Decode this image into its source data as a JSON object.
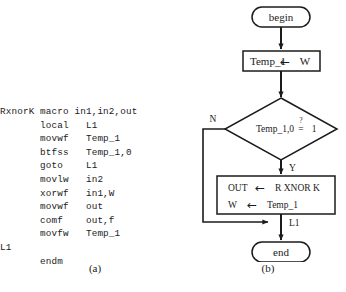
{
  "figure": {
    "caption_a": "(a)",
    "caption_b": "(b)"
  },
  "code": {
    "language": "pic-assembly",
    "listing": "RxnorK macro in1,in2,out\n       local   L1\n       movwf   Temp_1\n       btfss   Temp_1,0\n       goto    L1\n       movlw   in2\n       xorwf   in1,W\n       movwf   out\n       comf    out,f\n       movfw   Temp_1\nL1\n       endm",
    "lines": [
      {
        "label": "RxnorK",
        "mnemonic": "macro",
        "operands": "in1,in2,out"
      },
      {
        "label": "",
        "mnemonic": "local",
        "operands": "L1"
      },
      {
        "label": "",
        "mnemonic": "movwf",
        "operands": "Temp_1"
      },
      {
        "label": "",
        "mnemonic": "btfss",
        "operands": "Temp_1,0"
      },
      {
        "label": "",
        "mnemonic": "goto",
        "operands": "L1"
      },
      {
        "label": "",
        "mnemonic": "movlw",
        "operands": "in2"
      },
      {
        "label": "",
        "mnemonic": "xorwf",
        "operands": "in1,W"
      },
      {
        "label": "",
        "mnemonic": "movwf",
        "operands": "out"
      },
      {
        "label": "",
        "mnemonic": "comf",
        "operands": "out,f"
      },
      {
        "label": "",
        "mnemonic": "movfw",
        "operands": "Temp_1"
      },
      {
        "label": "L1",
        "mnemonic": "",
        "operands": ""
      },
      {
        "label": "",
        "mnemonic": "endm",
        "operands": ""
      }
    ]
  },
  "flowchart": {
    "begin_label": "begin",
    "end_label": "end",
    "assign_temp": "Temp_1",
    "assign_temp_arrow": "←",
    "assign_temp_source": "W",
    "decision_expr": "Temp_1,0",
    "decision_question": "?",
    "decision_eq": "=",
    "decision_value": "1",
    "branch_no": "N",
    "branch_yes": "Y",
    "process_out": "OUT",
    "process_out_arrow": "←",
    "process_out_expr": "R XNOR K",
    "process_w": "W",
    "process_w_arrow": "←",
    "process_w_expr": "Temp_1",
    "junction_label": "L1"
  },
  "colors": {
    "ink": "#1b1b1b",
    "paper": "#ffffff"
  }
}
